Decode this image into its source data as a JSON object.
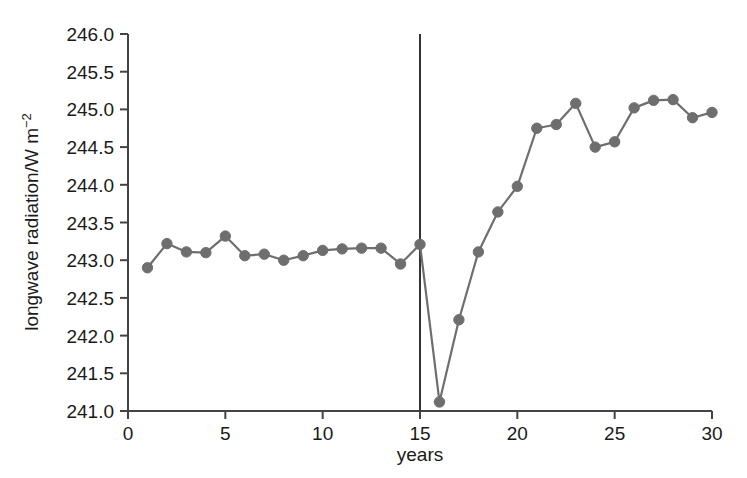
{
  "chart_data": {
    "type": "line",
    "title": "",
    "subtitle": "",
    "xlabel": "years",
    "ylabel": "longwave radiation/W m⁻²",
    "ylabel_base": "longwave radiation/W m",
    "ylabel_exponent": "−2",
    "xlim": [
      0,
      30
    ],
    "ylim": [
      241.0,
      246.0
    ],
    "xticks": [
      0,
      5,
      10,
      15,
      20,
      25,
      30
    ],
    "xtick_labels": [
      "0",
      "5",
      "10",
      "15",
      "20",
      "25",
      "30"
    ],
    "yticks": [
      241.0,
      241.5,
      242.0,
      242.5,
      243.0,
      243.5,
      244.0,
      244.5,
      245.0,
      245.5,
      246.0
    ],
    "ytick_labels": [
      "241.0",
      "241.5",
      "242.0",
      "242.5",
      "243.0",
      "243.5",
      "244.0",
      "244.5",
      "245.0",
      "245.5",
      "246.0"
    ],
    "grid": false,
    "legend": false,
    "x": [
      1,
      2,
      3,
      4,
      5,
      6,
      7,
      8,
      9,
      10,
      11,
      12,
      13,
      14,
      15,
      16,
      17,
      18,
      19,
      20,
      21,
      22,
      23,
      24,
      25,
      26,
      27,
      28,
      29,
      30
    ],
    "values": [
      242.9,
      243.22,
      243.11,
      243.1,
      243.32,
      243.06,
      243.08,
      243.0,
      243.06,
      243.13,
      243.15,
      243.16,
      243.16,
      242.95,
      243.21,
      241.12,
      242.21,
      243.11,
      243.64,
      243.98,
      244.75,
      244.8,
      245.08,
      244.5,
      244.57,
      245.02,
      245.12,
      245.13,
      244.89,
      244.96
    ],
    "series": [
      {
        "name": "longwave radiation",
        "color": "#6e6e6e",
        "marker": "circle",
        "values": [
          242.9,
          243.22,
          243.11,
          243.1,
          243.32,
          243.06,
          243.08,
          243.0,
          243.06,
          243.13,
          243.15,
          243.16,
          243.16,
          242.95,
          243.21,
          241.12,
          242.21,
          243.11,
          243.64,
          243.98,
          244.75,
          244.8,
          245.08,
          244.5,
          244.57,
          245.02,
          245.12,
          245.13,
          244.89,
          244.96
        ]
      }
    ],
    "annotations": [
      {
        "type": "vline",
        "name": "eruption-marker",
        "x": 15,
        "color": "#333333",
        "y_top": 246.0,
        "y_bottom": 241.0
      }
    ],
    "colors": {
      "line": "#6e6e6e",
      "marker": "#6e6e6e",
      "axis": "#444444",
      "text": "#1a1a1a",
      "vline": "#333333",
      "background": "#ffffff"
    }
  }
}
